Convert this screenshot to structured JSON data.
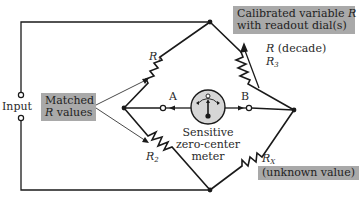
{
  "diagram": {
    "type": "Wheatstone bridge circuit",
    "input_label": "Input",
    "matched_box": {
      "line1": "Matched",
      "line2_var": "R",
      "line2_rest": " values"
    },
    "calibrated_box": {
      "line1_text": "Calibrated variable ",
      "line1_var": "R",
      "line2": "with readout dial(s)"
    },
    "r_decade": {
      "var": "R",
      "rest": " (decade)"
    },
    "resistors": [
      {
        "id": "R1",
        "base": "R",
        "sub": "1"
      },
      {
        "id": "R2",
        "base": "R",
        "sub": "2"
      },
      {
        "id": "R3",
        "base": "R",
        "sub": "3"
      },
      {
        "id": "RX",
        "base": "R",
        "sub": "X"
      }
    ],
    "unknown_label": "(unknown value)",
    "terminal_a": "A",
    "terminal_b": "B",
    "meter_label": [
      "Sensitive",
      "zero-center",
      "meter"
    ],
    "colors": {
      "wire": "#1a1a1a",
      "box_fill": "#a9a9a9",
      "meter_fill": "#d6d6d6"
    }
  }
}
